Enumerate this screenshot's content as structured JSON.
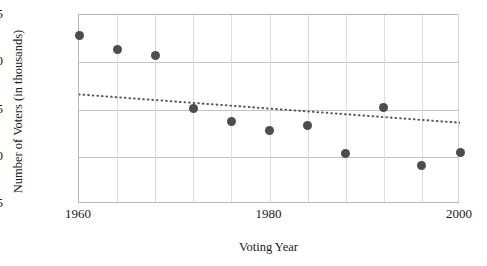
{
  "figure": {
    "clipped_title": "Voting Year vs Number of Voters",
    "background_color": "#ffffff",
    "marker_color": "#4d4d4d",
    "grid_color": "#c4c4c4",
    "axis_color": "#b9b9b9",
    "trendline_color": "#555555"
  },
  "chart_data": {
    "type": "scatter",
    "title": "",
    "xlabel": "Voting Year",
    "ylabel": "Number of Voters (in thousands)",
    "xlim": [
      1960,
      2000
    ],
    "ylim": [
      45,
      65
    ],
    "xticks": [
      1960,
      1980,
      2000
    ],
    "xtick_labels": [
      "1960",
      "1980",
      "2000"
    ],
    "xminor_step": 4,
    "yticks": [
      45,
      50,
      55,
      60,
      65
    ],
    "ytick_labels": [
      "45",
      "50",
      "55",
      "60",
      "65"
    ],
    "grid": true,
    "legend": null,
    "x": [
      1960,
      1964,
      1968,
      1972,
      1976,
      1980,
      1984,
      1988,
      1992,
      1996,
      2000
    ],
    "values": [
      62.8,
      61.4,
      60.7,
      55.1,
      53.7,
      52.8,
      53.3,
      50.3,
      55.2,
      49.1,
      50.4
    ],
    "points": [
      {
        "x": 1960,
        "y": 62.8
      },
      {
        "x": 1964,
        "y": 61.4
      },
      {
        "x": 1968,
        "y": 60.7
      },
      {
        "x": 1972,
        "y": 55.1
      },
      {
        "x": 1976,
        "y": 53.7
      },
      {
        "x": 1980,
        "y": 52.8
      },
      {
        "x": 1984,
        "y": 53.3
      },
      {
        "x": 1988,
        "y": 50.3
      },
      {
        "x": 1992,
        "y": 55.2
      },
      {
        "x": 1996,
        "y": 49.1
      },
      {
        "x": 2000,
        "y": 50.4
      }
    ],
    "trendline": {
      "style": "dotted",
      "x_start": 1960,
      "y_start": 56.6,
      "x_end": 2000,
      "y_end": 53.6
    }
  }
}
